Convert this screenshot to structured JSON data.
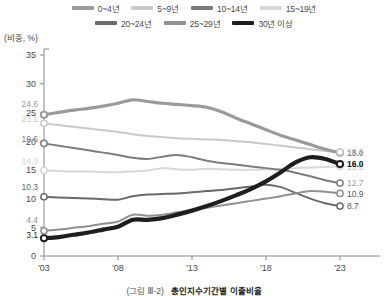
{
  "figure": {
    "caption_number": "(그림 Ⅲ-2)",
    "caption_title": "총인지수기간별 이출비율"
  },
  "axis": {
    "unit_label": "(비중, %)"
  },
  "legend": {
    "row1": [
      {
        "label": "0~4년",
        "color": "#9a9a9a",
        "width": 3.2
      },
      {
        "label": "5~9년",
        "color": "#c9c9c9",
        "width": 3.2
      },
      {
        "label": "10~14년",
        "color": "#7d7d7d",
        "width": 3.2
      },
      {
        "label": "15~19년",
        "color": "#d8d8d8",
        "width": 3.2
      }
    ],
    "row2": [
      {
        "label": "20~24년",
        "color": "#6a6a6a",
        "width": 3.2
      },
      {
        "label": "25~29년",
        "color": "#909090",
        "width": 3.2
      },
      {
        "label": "30년 이상",
        "color": "#1e1e1e",
        "width": 4.2
      }
    ]
  },
  "chart_data": {
    "type": "line",
    "title": "총인지수기간별 이출비율",
    "xlabel": "",
    "ylabel": "비중, %",
    "ylim": [
      0,
      35
    ],
    "ytick_values": [
      0,
      5,
      10,
      15,
      20,
      25,
      30,
      35
    ],
    "xlim": [
      2003,
      2023
    ],
    "xtick_values": [
      2003,
      2008,
      2013,
      2018,
      2023
    ],
    "xtick_labels": [
      "'03",
      "'08",
      "'13",
      "'18",
      "'23"
    ],
    "grid": false,
    "legend_position": "top",
    "x": [
      2003,
      2004,
      2005,
      2006,
      2007,
      2008,
      2009,
      2010,
      2011,
      2012,
      2013,
      2014,
      2015,
      2016,
      2017,
      2018,
      2019,
      2020,
      2021,
      2022,
      2023
    ],
    "series": [
      {
        "name": "0~4년",
        "color": "#9a9a9a",
        "width": 3.2,
        "start_label": "24.6",
        "end_label": "18.0",
        "end_label_color": "#8a8a8a",
        "values": [
          24.6,
          25.0,
          25.4,
          25.7,
          26.1,
          26.6,
          27.2,
          26.9,
          26.6,
          26.4,
          26.2,
          25.9,
          25.1,
          24.0,
          23.0,
          22.0,
          21.0,
          20.2,
          19.4,
          18.6,
          18.0
        ]
      },
      {
        "name": "5~9년",
        "color": "#c9c9c9",
        "width": 2.0,
        "start_label": "23.1",
        "end_label": "18.1",
        "end_label_color": "#bdbdbd",
        "values": [
          23.1,
          22.8,
          22.5,
          22.2,
          21.9,
          21.6,
          21.2,
          20.9,
          20.7,
          20.5,
          20.4,
          20.3,
          20.2,
          20.0,
          19.8,
          19.5,
          19.2,
          18.9,
          18.6,
          18.3,
          18.1
        ]
      },
      {
        "name": "10~14년",
        "color": "#7d7d7d",
        "width": 2.0,
        "start_label": "19.6",
        "end_label": "12.7",
        "end_label_color": "#9d9d9d",
        "values": [
          19.6,
          19.2,
          18.8,
          18.4,
          18.0,
          17.6,
          17.1,
          16.9,
          17.3,
          17.6,
          17.2,
          16.6,
          16.2,
          15.9,
          15.6,
          15.3,
          15.0,
          14.5,
          13.9,
          13.2,
          12.7
        ]
      },
      {
        "name": "15~19년",
        "color": "#d8d8d8",
        "width": 2.0,
        "start_label": "14.9",
        "end_label": "15.6",
        "end_label_color": "#c3c3c3",
        "values": [
          14.9,
          14.8,
          14.7,
          14.7,
          14.6,
          14.6,
          14.7,
          14.9,
          15.3,
          15.1,
          15.0,
          15.2,
          15.1,
          15.0,
          15.0,
          15.1,
          15.2,
          15.3,
          15.4,
          15.5,
          15.6
        ]
      },
      {
        "name": "20~24년",
        "color": "#6a6a6a",
        "width": 2.0,
        "start_label": "10.3",
        "end_label": "8.7",
        "end_label_color": "#555555",
        "values": [
          10.3,
          10.2,
          10.1,
          10.0,
          9.9,
          9.8,
          10.4,
          10.7,
          10.8,
          10.9,
          11.1,
          11.3,
          11.5,
          11.8,
          12.1,
          12.4,
          12.0,
          11.0,
          10.0,
          9.2,
          8.7
        ]
      },
      {
        "name": "25~29년",
        "color": "#909090",
        "width": 2.0,
        "start_label": "4.4",
        "end_label": "10.9",
        "end_label_color": "#555555",
        "values": [
          4.4,
          4.6,
          4.9,
          5.2,
          5.6,
          6.0,
          7.2,
          7.0,
          7.2,
          7.6,
          8.0,
          8.4,
          8.8,
          9.2,
          9.6,
          10.0,
          10.4,
          10.9,
          11.3,
          11.2,
          10.9
        ]
      },
      {
        "name": "30년 이상",
        "color": "#1e1e1e",
        "width": 4.2,
        "start_label": "3.1",
        "end_label": "16.0",
        "end_label_color": "#111111",
        "values": [
          3.1,
          3.3,
          3.7,
          4.1,
          4.6,
          5.1,
          6.3,
          6.3,
          6.6,
          7.2,
          7.9,
          8.7,
          9.6,
          10.6,
          11.7,
          13.0,
          14.6,
          16.3,
          17.2,
          16.9,
          16.0
        ]
      }
    ]
  }
}
